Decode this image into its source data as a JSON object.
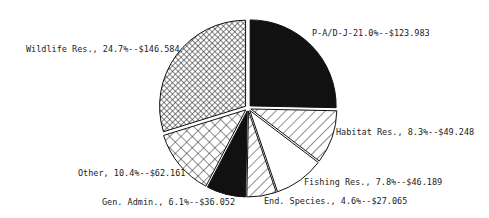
{
  "chart_data": {
    "type": "pie",
    "title": "",
    "units": "$ (thousands)",
    "slices": [
      {
        "label": "P-A/D-J",
        "percent": 21.0,
        "value": 123.983,
        "text": "P-A/D-J-21.0%--$123.983",
        "fill": "solid-black"
      },
      {
        "label": "Habitat Res.",
        "percent": 8.3,
        "value": 49.248,
        "text": "Habitat Res., 8.3%--$49.248",
        "fill": "diagonal-hatch"
      },
      {
        "label": "Fishing Res.",
        "percent": 7.8,
        "value": 46.189,
        "text": "Fishing Res., 7.8%--$46.189",
        "fill": "white"
      },
      {
        "label": "End. Species",
        "percent": 4.6,
        "value": 27.065,
        "text": "End. Species., 4.6%--$27.065",
        "fill": "diagonal-hatch"
      },
      {
        "label": "Gen. Admin.",
        "percent": 6.1,
        "value": 36.052,
        "text": "Gen. Admin., 6.1%--$36.052",
        "fill": "solid-black"
      },
      {
        "label": "Other",
        "percent": 10.4,
        "value": 62.161,
        "text": "Other, 10.4%--$62.161",
        "fill": "cross-hatch"
      },
      {
        "label": "Wildlife Res.",
        "percent": 24.7,
        "value": 146.584,
        "text": "Wildlife Res., 24.7%--$146.584",
        "fill": "fine-checker"
      }
    ],
    "legend": "none (direct labels with leader lines)"
  }
}
